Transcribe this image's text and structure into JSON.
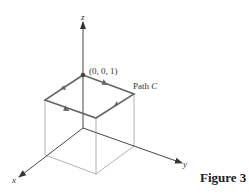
{
  "figure": {
    "caption": "Figure 3",
    "axes": {
      "x_label": "x",
      "y_label": "y",
      "z_label": "z"
    },
    "point_label": "(0, 0, 1)",
    "path_label_prefix": "Path ",
    "path_label_var": "C"
  },
  "colors": {
    "path": "#666666",
    "cube": "#9a9a9a",
    "axis": "#333333",
    "text": "#333333"
  }
}
